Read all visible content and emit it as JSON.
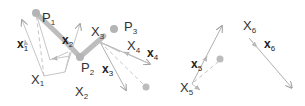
{
  "colors": {
    "background": "#ffffff",
    "path": "#b8b8b8",
    "arrow": "#a8a8a8",
    "dashed": "#c4c4c4",
    "dot": "#b4b4b4",
    "text": "#333333"
  },
  "labels": {
    "P1": {
      "base": "P",
      "sub": "1"
    },
    "P2": {
      "base": "P",
      "sub": "2"
    },
    "P3": {
      "base": "P",
      "sub": "3"
    },
    "X1": {
      "base": "X",
      "sub": "1"
    },
    "X2": {
      "base": "X",
      "sub": "2"
    },
    "X3": {
      "base": "X",
      "sub": "3"
    },
    "X4": {
      "base": "X",
      "sub": "4"
    },
    "X5": {
      "base": "X",
      "sub": "5"
    },
    "X6": {
      "base": "X",
      "sub": "6"
    },
    "x1": {
      "base": "x",
      "sub": "1"
    },
    "x2": {
      "base": "x",
      "sub": "2"
    },
    "x3": {
      "base": "x",
      "sub": "3"
    },
    "x4": {
      "base": "x",
      "sub": "4"
    },
    "x5": {
      "base": "x",
      "sub": "5"
    },
    "x6": {
      "base": "x",
      "sub": "6"
    }
  }
}
